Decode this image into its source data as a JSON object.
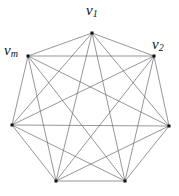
{
  "diagram": {
    "type": "complete-graph",
    "name": "K7",
    "vertices": [
      {
        "id": "v1",
        "x": 92,
        "y": 33,
        "label_main": "v",
        "label_sub": "1",
        "label_x": 86,
        "label_y": 3
      },
      {
        "id": "v2",
        "x": 154,
        "y": 56,
        "label_main": "v",
        "label_sub": "2",
        "label_x": 152,
        "label_y": 37
      },
      {
        "id": "v3",
        "x": 169,
        "y": 126,
        "label_main": "",
        "label_sub": ""
      },
      {
        "id": "v4",
        "x": 125,
        "y": 181,
        "label_main": "",
        "label_sub": ""
      },
      {
        "id": "v5",
        "x": 56,
        "y": 181,
        "label_main": "",
        "label_sub": ""
      },
      {
        "id": "v6",
        "x": 12,
        "y": 125,
        "label_main": "",
        "label_sub": ""
      },
      {
        "id": "vm",
        "x": 28,
        "y": 56,
        "label_main": "v",
        "label_sub": "m",
        "label_x": 4,
        "label_y": 43
      }
    ],
    "edge_color": "#6a6a6a",
    "vertex_color": "#111111"
  }
}
